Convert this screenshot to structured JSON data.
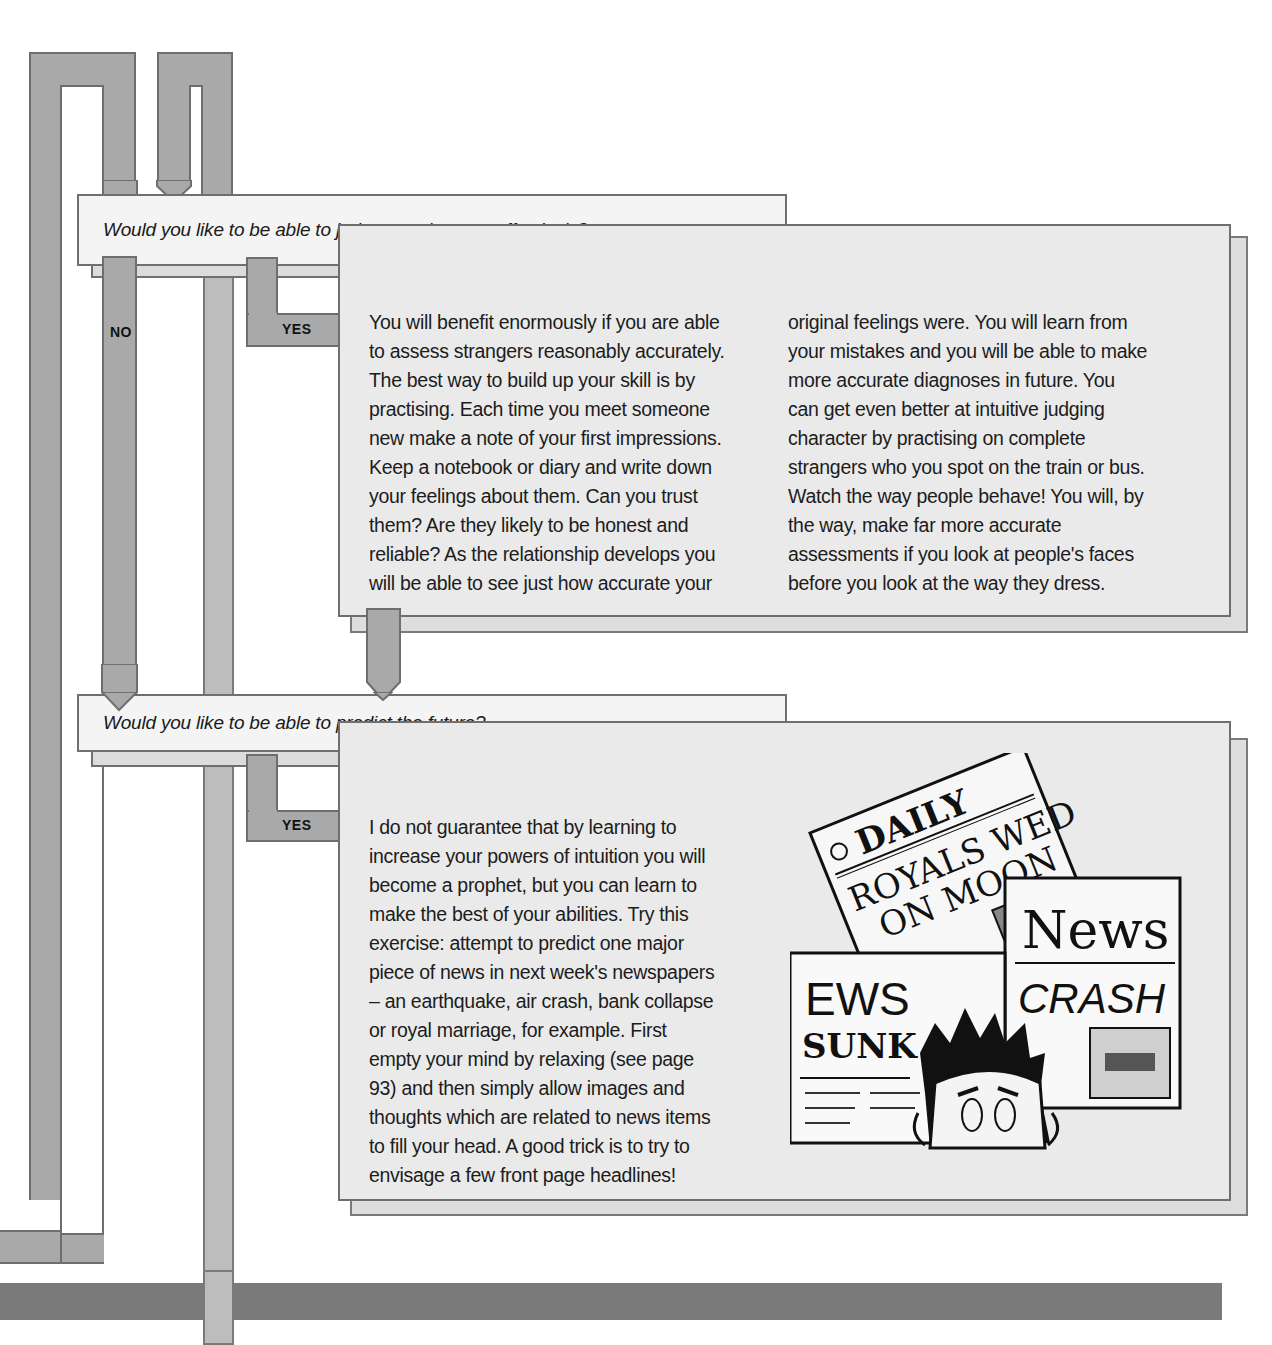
{
  "flowchart": {
    "questions": [
      {
        "text": "Would you like to be able to judge people more effectively?",
        "no_label": "NO",
        "yes_label": "YES",
        "answer": {
          "columns": [
            [
              "You will benefit enormously if you are able",
              "to assess strangers reasonably accurately.",
              "The best way to build up your skill is by",
              "practising. Each time you meet someone",
              "new make a note of your first impressions.",
              "Keep a notebook or diary and write down",
              "your feelings about them. Can you trust",
              "them? Are they likely to be honest and",
              "reliable? As the relationship develops you",
              "will be able to see just how accurate your"
            ],
            [
              "original feelings were. You will learn from",
              "your mistakes and you will be able to make",
              "more accurate diagnoses in future. You",
              "can get even better at intuitive judging",
              "character by practising on complete",
              "strangers who you spot on the train or bus.",
              "Watch the way people behave! You will, by",
              "the way, make far more accurate",
              "assessments if you look at people's faces",
              "before you look at the way they dress."
            ]
          ]
        }
      },
      {
        "text": "Would you like to be able to predict the future?",
        "yes_label": "YES",
        "answer": {
          "lines": [
            "I do not guarantee that by learning to",
            "increase your powers of intuition you will",
            "become a prophet, but you can learn to",
            "make the best of your abilities. Try this",
            "exercise: attempt to predict one major",
            "piece of news in next week's newspapers",
            "– an earthquake, air crash, bank collapse",
            "or royal marriage, for example. First",
            "empty your mind by relaxing (see page",
            "93) and then simply allow images and",
            "thoughts which are related to news items",
            "to fill your head. A good trick is to try to",
            "envisage a few front page headlines!"
          ]
        }
      }
    ],
    "illustration": {
      "description": "newspapers-cartoon",
      "headlines": {
        "paper1_masthead": "DAILY",
        "paper1_headline_line1": "ROYALS WED",
        "paper1_headline_line2": "ON MOON",
        "paper2_masthead": "News",
        "paper2_headline": "CRASH",
        "paper3_headline_line1": "EWS",
        "paper3_headline_line2": "SUNK"
      }
    }
  },
  "colors": {
    "pipe": "#a9a9a9",
    "pipe_border": "#6e6e6e",
    "question_bg": "#f4f4f4",
    "answer_bg": "#eaeaea",
    "bottom_bar": "#7a7a7a"
  }
}
